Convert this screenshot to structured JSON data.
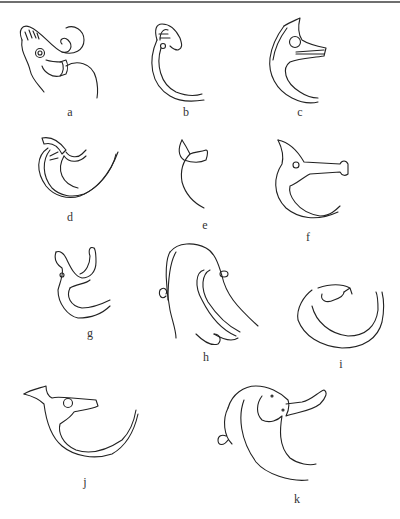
{
  "figure": {
    "panels": [
      {
        "id": "a",
        "label": "a",
        "x": 70,
        "y": 106
      },
      {
        "id": "b",
        "label": "b",
        "x": 186,
        "y": 106
      },
      {
        "id": "c",
        "label": "c",
        "x": 300,
        "y": 106
      },
      {
        "id": "d",
        "label": "d",
        "x": 70,
        "y": 211
      },
      {
        "id": "e",
        "label": "e",
        "x": 205,
        "y": 219
      },
      {
        "id": "f",
        "label": "f",
        "x": 308,
        "y": 231
      },
      {
        "id": "g",
        "label": "g",
        "x": 90,
        "y": 327
      },
      {
        "id": "h",
        "label": "h",
        "x": 206,
        "y": 351
      },
      {
        "id": "i",
        "label": "i",
        "x": 341,
        "y": 358
      },
      {
        "id": "j",
        "label": "j",
        "x": 85,
        "y": 476
      },
      {
        "id": "k",
        "label": "k",
        "x": 297,
        "y": 493
      }
    ]
  }
}
